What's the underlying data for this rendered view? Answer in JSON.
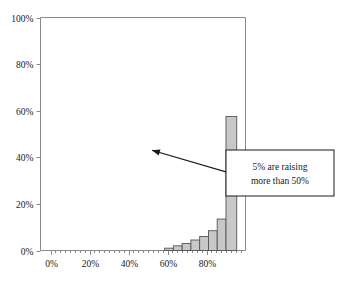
{
  "chart_data": {
    "type": "bar",
    "title": "",
    "subtitle": "",
    "xlabel": "",
    "ylabel": "",
    "xlim": [
      0,
      100
    ],
    "ylim": [
      0,
      100
    ],
    "grid": false,
    "legend": null,
    "x_tick_labels": [
      "0%",
      "20%",
      "40%",
      "60%",
      "80%"
    ],
    "x_tick_values": [
      0,
      20,
      40,
      60,
      80
    ],
    "x_minor_tick_step": 2.5,
    "y_tick_labels": [
      "0%",
      "20%",
      "40%",
      "60%",
      "80%",
      "100%"
    ],
    "y_tick_values": [
      0,
      20,
      40,
      60,
      80,
      100
    ],
    "bar_fill_color": "#c8c8c8",
    "bar_edge_color": "#555555",
    "axis_color": "#808080",
    "categories": [
      "57.5%",
      "60%",
      "62.5%",
      "65%",
      "67.5%",
      "70%",
      "72.5%",
      "75%",
      "77.5%",
      "80%",
      "82.5%",
      "85%",
      "87.5%",
      "90%",
      "92.5%",
      "95%"
    ],
    "bin_starts": [
      57.5,
      60,
      62.5,
      65,
      67.5,
      70,
      72.5,
      75,
      77.5,
      80,
      82.5,
      85,
      87.5,
      90,
      92.5,
      95
    ],
    "bin_width": 2.5,
    "values": [
      0,
      1.0,
      1.0,
      2.0,
      2.0,
      3.0,
      3.0,
      4.5,
      4.5,
      6.0,
      6.0,
      8.5,
      8.5,
      13.5,
      13.5,
      57.5
    ],
    "bars": [
      {
        "x_start": 58.5,
        "x_end": 63.0,
        "value": 1.0
      },
      {
        "x_start": 63.0,
        "x_end": 67.5,
        "value": 2.0
      },
      {
        "x_start": 67.5,
        "x_end": 72.0,
        "value": 3.0
      },
      {
        "x_start": 72.0,
        "x_end": 76.5,
        "value": 4.5
      },
      {
        "x_start": 76.5,
        "x_end": 81.0,
        "value": 6.0
      },
      {
        "x_start": 81.0,
        "x_end": 85.5,
        "value": 8.5
      },
      {
        "x_start": 85.5,
        "x_end": 90.0,
        "value": 13.5
      },
      {
        "x_start": 90.0,
        "x_end": 95.5,
        "value": 57.5
      }
    ],
    "annotations": [
      {
        "name": "callout-5-percent",
        "line1": "5% are raising",
        "line2": "more than 50%",
        "arrow_from_x": 93,
        "arrow_from_y": 33,
        "arrow_to_x": 52,
        "arrow_to_y": 43
      }
    ]
  }
}
